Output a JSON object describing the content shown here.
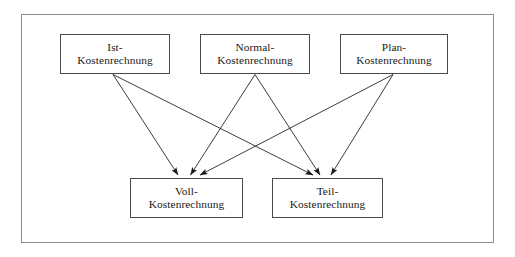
{
  "diagram": {
    "frame": {
      "border_color": "#8d8d8d",
      "background": "#ffffff"
    },
    "node_style": {
      "border_color": "#4a4a4a",
      "text_color": "#1a1a1a",
      "background": "#ffffff"
    },
    "edge_style": {
      "color": "#1a1a1a",
      "arrowhead": "filled-triangle"
    },
    "nodes": [
      {
        "id": "ist",
        "line1": "Ist-",
        "line2": "Kostenrechnung",
        "row": "top",
        "x": 60,
        "y": 34,
        "w": 110,
        "h": 40
      },
      {
        "id": "normal",
        "line1": "Normal-",
        "line2": "Kostenrechnung",
        "row": "top",
        "x": 200,
        "y": 34,
        "w": 110,
        "h": 40
      },
      {
        "id": "plan",
        "line1": "Plan-",
        "line2": "Kostenrechnung",
        "row": "top",
        "x": 340,
        "y": 34,
        "w": 108,
        "h": 40
      },
      {
        "id": "voll",
        "line1": "Voll-",
        "line2": "Kostenrechnung",
        "row": "bottom",
        "x": 130,
        "y": 178,
        "w": 113,
        "h": 40
      },
      {
        "id": "teil",
        "line1": "Teil-",
        "line2": "Kostenrechnung",
        "row": "bottom",
        "x": 272,
        "y": 178,
        "w": 111,
        "h": 40
      }
    ],
    "edges": [
      {
        "id": "ist-voll",
        "from": "ist",
        "to": "voll",
        "from_label": "Ist-Kostenrechnung",
        "to_label": "Voll-Kostenrechnung"
      },
      {
        "id": "ist-teil",
        "from": "ist",
        "to": "teil",
        "from_label": "Ist-Kostenrechnung",
        "to_label": "Teil-Kostenrechnung"
      },
      {
        "id": "normal-voll",
        "from": "normal",
        "to": "voll",
        "from_label": "Normal-Kostenrechnung",
        "to_label": "Voll-Kostenrechnung"
      },
      {
        "id": "normal-teil",
        "from": "normal",
        "to": "teil",
        "from_label": "Normal-Kostenrechnung",
        "to_label": "Teil-Kostenrechnung"
      },
      {
        "id": "plan-voll",
        "from": "plan",
        "to": "voll",
        "from_label": "Plan-Kostenrechnung",
        "to_label": "Voll-Kostenrechnung"
      },
      {
        "id": "plan-teil",
        "from": "plan",
        "to": "teil",
        "from_label": "Plan-Kostenrechnung",
        "to_label": "Teil-Kostenrechnung"
      }
    ]
  }
}
